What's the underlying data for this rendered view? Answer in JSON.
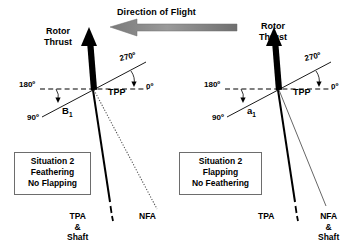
{
  "figure": {
    "flight_direction_label": "Direction of Flight"
  },
  "colors": {
    "ink": "#000000",
    "box_border": "#6d6d6d",
    "flight_arrow_fill": "#8c8c8c",
    "nfa_line": "#555555",
    "paper": "#ffffff"
  },
  "panels": [
    {
      "id": "left",
      "thrust_label": "Rotor\nThrust",
      "angles": {
        "a270": "270º",
        "a0": "0º",
        "a180": "180º",
        "a90": "90º"
      },
      "tpp_label": "TPP",
      "angle_symbol": "B",
      "angle_symbol_sub": "1",
      "situation_box": "Situation 2\nFeathering\nNo Flapping",
      "left_axis_label": "TPA\n&\nShaft",
      "right_axis_label": "NFA"
    },
    {
      "id": "right",
      "thrust_label": "Rotor\nThrust",
      "angles": {
        "a270": "270º",
        "a0": "0º",
        "a180": "180º",
        "a90": "90º"
      },
      "tpp_label": "TPP",
      "angle_symbol": "a",
      "angle_symbol_sub": "1",
      "situation_box": "Situation 2\nFlapping\nNo Feathering",
      "left_axis_label": "TPA",
      "right_axis_label": "NFA\n&\nShaft"
    }
  ]
}
